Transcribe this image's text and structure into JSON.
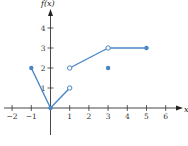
{
  "chart_data": {
    "type": "line",
    "title": "",
    "xlabel": "x",
    "ylabel": "f(x)",
    "xlim": [
      -2.3,
      6.5
    ],
    "ylim": [
      -1.4,
      4.8
    ],
    "grid": false,
    "x_ticks": [
      -2,
      -1,
      1,
      2,
      3,
      4,
      5,
      6
    ],
    "y_ticks": [
      1,
      2,
      3,
      4
    ],
    "x_tick_labels": [
      "−2",
      "−1",
      "1",
      "2",
      "3",
      "4",
      "5",
      "6"
    ],
    "y_tick_labels": [
      "1",
      "2",
      "3",
      "4"
    ],
    "segments": [
      {
        "from": [
          -1,
          2
        ],
        "to": [
          0,
          0
        ]
      },
      {
        "from": [
          0,
          0
        ],
        "to": [
          1,
          1
        ]
      },
      {
        "from": [
          1,
          2
        ],
        "to": [
          3,
          3
        ]
      },
      {
        "from": [
          3,
          3
        ],
        "to": [
          5,
          3
        ]
      }
    ],
    "closed_points": [
      [
        -1,
        2
      ],
      [
        0,
        0
      ],
      [
        3,
        2
      ],
      [
        5,
        3
      ]
    ],
    "open_points": [
      [
        1,
        1
      ],
      [
        1,
        2
      ],
      [
        3,
        3
      ]
    ],
    "line_color": "#4a86c5"
  }
}
